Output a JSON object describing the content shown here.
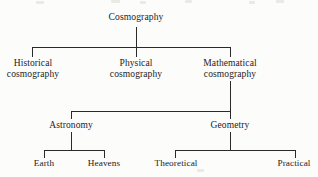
{
  "diagram": {
    "type": "tree",
    "title": "Cosmography",
    "background_color": "#fcfcfb",
    "line_color": "#2a2a2a",
    "text_color": "#1b1b1b",
    "nodes": {
      "root": {
        "label": "Cosmography"
      },
      "level2": [
        {
          "id": "historical",
          "label": "Historical\ncosmography"
        },
        {
          "id": "physical",
          "label": "Physical\ncosmography"
        },
        {
          "id": "mathematical",
          "label": "Mathematical\ncosmography"
        }
      ],
      "level3": [
        {
          "id": "astronomy",
          "label": "Astronomy"
        },
        {
          "id": "geometry",
          "label": "Geometry"
        }
      ],
      "level4": [
        {
          "id": "earth",
          "label": "Earth"
        },
        {
          "id": "heavens",
          "label": "Heavens"
        },
        {
          "id": "theoretical",
          "label": "Theoretical"
        },
        {
          "id": "practical",
          "label": "Practical"
        }
      ]
    },
    "edges": [
      {
        "from": "root",
        "to": "historical"
      },
      {
        "from": "root",
        "to": "physical"
      },
      {
        "from": "root",
        "to": "mathematical"
      },
      {
        "from": "mathematical",
        "to": "astronomy"
      },
      {
        "from": "mathematical",
        "to": "geometry"
      },
      {
        "from": "astronomy",
        "to": "earth"
      },
      {
        "from": "astronomy",
        "to": "heavens"
      },
      {
        "from": "geometry",
        "to": "theoretical"
      },
      {
        "from": "geometry",
        "to": "practical"
      }
    ]
  }
}
